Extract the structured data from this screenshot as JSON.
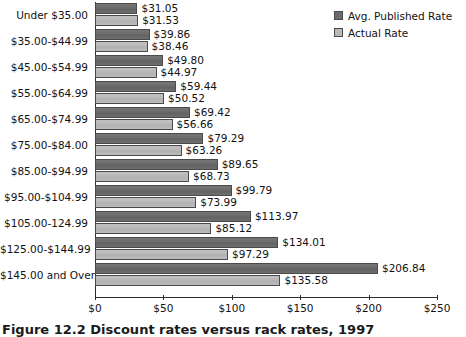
{
  "chart_data": {
    "type": "bar",
    "orientation": "horizontal",
    "title": "",
    "xlabel": "",
    "ylabel": "",
    "xlim": [
      0,
      250
    ],
    "grid": false,
    "legend_position": "top-right",
    "categories": [
      "Under $35.00",
      "$35.00-$44.99",
      "$45.00-$54.99",
      "$55.00-$64.99",
      "$65.00-$74.99",
      "$75.00-$84.00",
      "$85.00-$94.99",
      "$95.00-$104.99",
      "$105.00-124.99",
      "$125.00-$144.99",
      "$145.00 and Over"
    ],
    "series": [
      {
        "name": "Avg. Published Rate",
        "color": "#6b6b6b",
        "values": [
          31.05,
          39.86,
          49.8,
          59.44,
          69.42,
          79.29,
          89.65,
          99.79,
          113.97,
          134.01,
          206.84
        ],
        "labels": [
          "$31.05",
          "$39.86",
          "$49.80",
          "$59.44",
          "$69.42",
          "$79.29",
          "$89.65",
          "$99.79",
          "$113.97",
          "$134.01",
          "$206.84"
        ]
      },
      {
        "name": "Actual Rate",
        "color": "#b9b9b9",
        "values": [
          31.53,
          38.46,
          44.97,
          50.52,
          56.66,
          63.26,
          68.73,
          73.99,
          85.12,
          97.29,
          135.58
        ],
        "labels": [
          "$31.53",
          "$38.46",
          "$44.97",
          "$50.52",
          "$56.66",
          "$63.26",
          "$68.73",
          "$73.99",
          "$85.12",
          "$97.29",
          "$135.58"
        ]
      }
    ],
    "xticks": [
      0,
      50,
      100,
      150,
      200,
      250
    ],
    "xtick_labels": [
      "$0",
      "$50",
      "$100",
      "$150",
      "$200",
      "$250"
    ]
  },
  "legend": {
    "items": [
      {
        "label": "Avg. Published Rate",
        "swatch": "published"
      },
      {
        "label": "Actual Rate",
        "swatch": "actual"
      }
    ]
  },
  "caption": {
    "text": "Figure 12.2   Discount rates versus rack rates, 1997"
  }
}
